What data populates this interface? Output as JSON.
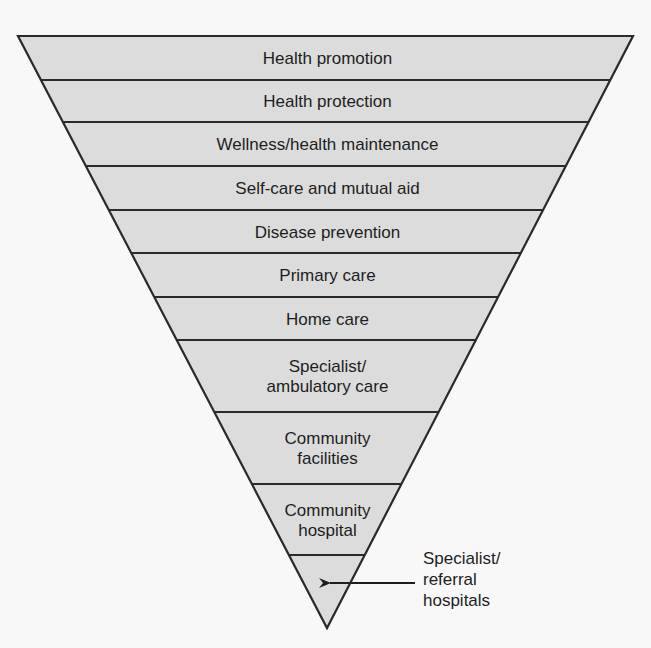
{
  "diagram": {
    "type": "inverted-pyramid",
    "fill_color": "#dcdcdc",
    "stroke_color": "#2a2a2a",
    "levels": [
      {
        "label": "Health promotion"
      },
      {
        "label": "Health protection"
      },
      {
        "label": "Wellness/health maintenance"
      },
      {
        "label": "Self-care and mutual aid"
      },
      {
        "label": "Disease prevention"
      },
      {
        "label": "Primary care"
      },
      {
        "label": "Home care"
      },
      {
        "label": "Specialist/\nambulatory care"
      },
      {
        "label": "Community\nfacilities"
      },
      {
        "label": "Community\nhospital"
      },
      {
        "label": ""
      }
    ],
    "callout": {
      "label": "Specialist/\nreferral\nhospitals",
      "points_to_level": 10
    }
  }
}
